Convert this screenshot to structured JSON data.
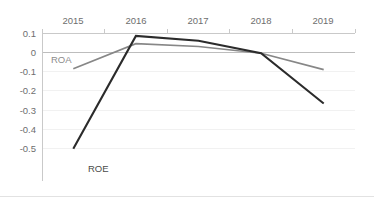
{
  "chart_data": {
    "type": "line",
    "title": "",
    "subtitle": "",
    "xlabel": "",
    "ylabel": "",
    "categories": [
      "2015",
      "2016",
      "2017",
      "2018",
      "2019"
    ],
    "x_axis_position": "top",
    "grid": true,
    "legend": "inline-labels",
    "ylim": [
      -0.5,
      0.1
    ],
    "y_ticks": [
      "0.1",
      "0",
      "-0.1",
      "-0.2",
      "-0.3",
      "-0.4",
      "-0.5"
    ],
    "y_tick_values": [
      0.1,
      0,
      -0.1,
      -0.2,
      -0.3,
      -0.4,
      -0.5
    ],
    "zero_line": 0,
    "series": [
      {
        "name": "ROE",
        "color": "#2b2b2b",
        "values": [
          -0.5,
          0.085,
          0.06,
          -0.005,
          -0.265
        ]
      },
      {
        "name": "ROA",
        "color": "#878787",
        "values": [
          -0.085,
          0.045,
          0.03,
          -0.005,
          -0.09
        ]
      }
    ],
    "annotations": [
      {
        "text": "ROA",
        "series": "ROA",
        "x": 2015,
        "y": -0.03
      },
      {
        "text": "ROE",
        "series": "ROE",
        "x": 2015,
        "y": -0.455
      }
    ]
  },
  "axis": {
    "y_labels": [
      "0.1",
      "0",
      "-0.1",
      "-0.2",
      "-0.3",
      "-0.4",
      "-0.5"
    ],
    "x_labels": [
      "2015",
      "2016",
      "2017",
      "2018",
      "2019"
    ]
  },
  "labels": {
    "roa": "ROA",
    "roe": "ROE"
  },
  "colors": {
    "roe_line": "#2b2b2b",
    "roa_line": "#878787",
    "gridline": "#f1f1f1",
    "zeroline": "#bdbdbd",
    "axisline": "#c9c9c9",
    "tick_text": "#6e6e6e",
    "background": "#ffffff"
  }
}
